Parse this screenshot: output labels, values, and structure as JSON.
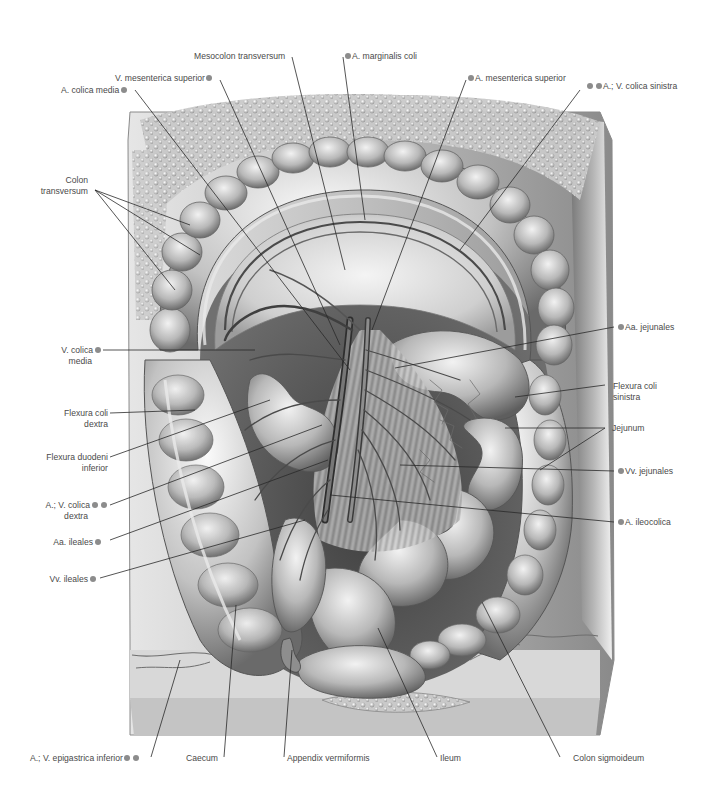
{
  "figure": {
    "colors": {
      "background": "#ffffff",
      "label_text": "#4a4a4a",
      "leader_line": "#2a2a2a",
      "marker_dot": "#8c8c8c",
      "tissue_light": "#d9d9d9",
      "tissue_mid": "#a8a8a8",
      "tissue_dark": "#5a5a5a"
    }
  },
  "labels": {
    "top": [
      {
        "id": "mesocolon-transversum",
        "text": "Mesocolon transversum",
        "dots": 0
      },
      {
        "id": "a-marginalis-coli",
        "text": "A. marginalis coli",
        "dots": 1,
        "dot_side": "left"
      },
      {
        "id": "v-mesenterica-superior",
        "text": "V. mesenterica superior",
        "dots": 1,
        "dot_side": "right"
      },
      {
        "id": "a-mesenterica-superior",
        "text": "A. mesenterica superior",
        "dots": 1,
        "dot_side": "left"
      },
      {
        "id": "a-colica-media",
        "text": "A. colica media",
        "dots": 1,
        "dot_side": "right"
      },
      {
        "id": "a-v-colica-sinistra",
        "text": "A.; V. colica sinistra",
        "dots": 2,
        "dot_side": "left"
      }
    ],
    "left": [
      {
        "id": "colon-transversum",
        "line1": "Colon",
        "line2": "transversum",
        "dots": 0
      },
      {
        "id": "v-colica-media",
        "line1": "V. colica",
        "line2": "media",
        "dots": 1
      },
      {
        "id": "flexura-coli-dextra",
        "line1": "Flexura coli",
        "line2": "dextra",
        "dots": 0
      },
      {
        "id": "flexura-duodeni-inferior",
        "line1": "Flexura duodeni",
        "line2": "inferior",
        "dots": 0
      },
      {
        "id": "a-v-colica-dextra",
        "line1": "A.; V. colica",
        "line2": "dextra",
        "dots": 2
      },
      {
        "id": "aa-ileales",
        "line1": "Aa. ileales",
        "line2": "",
        "dots": 1
      },
      {
        "id": "vv-ileales",
        "line1": "Vv. ileales",
        "line2": "",
        "dots": 1
      }
    ],
    "right": [
      {
        "id": "aa-jejunales",
        "line1": "Aa. jejunales",
        "line2": "",
        "dots": 1
      },
      {
        "id": "flexura-coli-sinistra",
        "line1": "Flexura coli",
        "line2": "sinistra",
        "dots": 0
      },
      {
        "id": "jejunum",
        "line1": "Jejunum",
        "line2": "",
        "dots": 0
      },
      {
        "id": "vv-jejunales",
        "line1": "Vv. jejunales",
        "line2": "",
        "dots": 1
      },
      {
        "id": "a-ileocolica",
        "line1": "A. ileocolica",
        "line2": "",
        "dots": 1
      }
    ],
    "bottom": [
      {
        "id": "a-v-epigastrica-inferior",
        "text": "A.; V. epigastrica inferior",
        "dots": 2
      },
      {
        "id": "caecum",
        "text": "Caecum",
        "dots": 0
      },
      {
        "id": "appendix-vermiformis",
        "text": "Appendix vermiformis",
        "dots": 0
      },
      {
        "id": "ileum",
        "text": "Ileum",
        "dots": 0
      },
      {
        "id": "colon-sigmoideum",
        "text": "Colon sigmoideum",
        "dots": 0
      }
    ]
  }
}
